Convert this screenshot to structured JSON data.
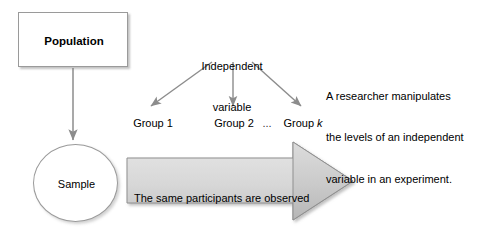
{
  "diagram": {
    "population": {
      "label": "Population",
      "shape": "rectangle"
    },
    "sample": {
      "label": "Sample",
      "shape": "ellipse"
    },
    "independent_variable": {
      "line1": "Independent",
      "line2": "variable"
    },
    "groups": {
      "group1": "Group 1",
      "group2": "Group 2",
      "ellipsis": "...",
      "group_k_prefix": "Group ",
      "group_k_symbol": "k"
    },
    "researcher_note": {
      "line1": "A researcher manipulates",
      "line2": "the levels of an independent",
      "line3": "variable in an experiment."
    },
    "banner": {
      "line1": "The same participants are observed",
      "line2": "in each group."
    },
    "colors": {
      "background": "#ffffff",
      "text": "#000000",
      "shape_border": "#9a9a9a",
      "arrow_stroke": "#8c8c8c",
      "banner_body_fill": "#d7d7d7",
      "banner_head_fill": "#c6c6c6",
      "banner_border": "#8f8f8f"
    }
  }
}
